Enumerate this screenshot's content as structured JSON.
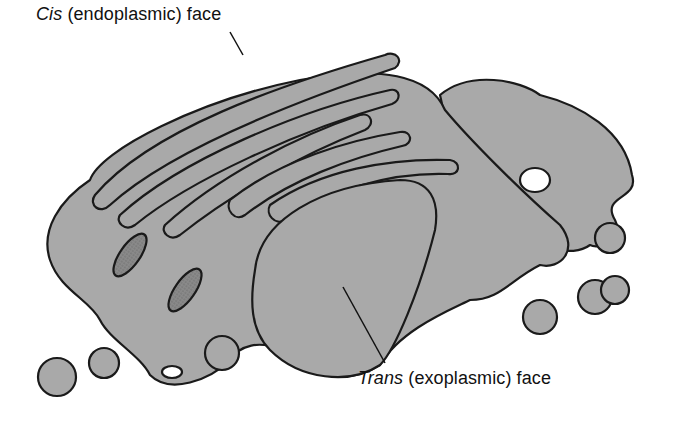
{
  "diagram": {
    "labels": {
      "cis": {
        "italic": "Cis",
        "rest": " (endoplasmic) face"
      },
      "trans": {
        "italic": "Trans",
        "rest": " (exoplasmic) face"
      }
    },
    "colors": {
      "membrane_fill": "#a9a9a9",
      "outline": "#1a1a1a",
      "lumen": "#8c8c8c",
      "background": "#ffffff"
    }
  }
}
